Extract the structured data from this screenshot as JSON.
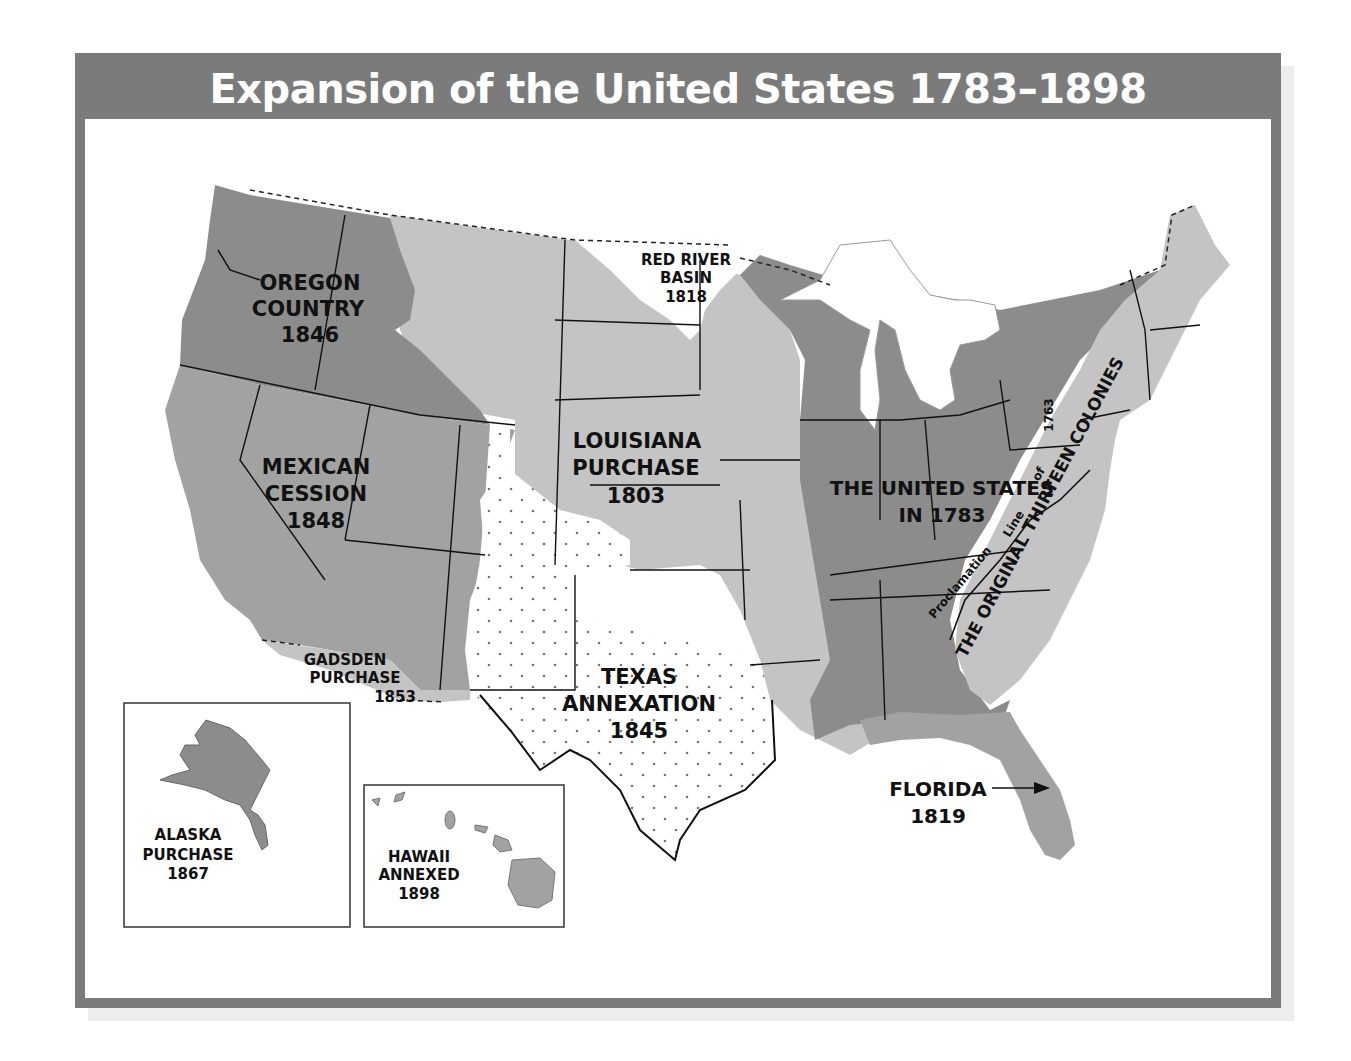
{
  "title": "Expansion of the United States 1783–1898",
  "colors": {
    "frame": "#7b7b7b",
    "dark_territory": "#8c8c8c",
    "medium_territory": "#a2a2a2",
    "light_territory": "#c4c4c4",
    "texas_fill": "#ffffff",
    "border_lines": "#111111"
  },
  "regions": {
    "oregon": {
      "line1": "OREGON",
      "line2": "COUNTRY",
      "year": "1846"
    },
    "mexican": {
      "line1": "MEXICAN",
      "line2": "CESSION",
      "year": "1848"
    },
    "gadsden": {
      "line1": "GADSDEN",
      "line2": "PURCHASE",
      "year": "1853"
    },
    "louisiana": {
      "line1": "LOUISIANA",
      "line2": "PURCHASE",
      "year": "1803"
    },
    "red_river": {
      "line1": "RED RIVER",
      "line2": "BASIN",
      "year": "1818"
    },
    "texas": {
      "line1": "TEXAS",
      "line2": "ANNEXATION",
      "year": "1845"
    },
    "us1783": {
      "line1": "THE UNITED STATES",
      "line2": "IN 1783"
    },
    "colonies": {
      "label": "THE ORIGINAL THIRTEEN COLONIES"
    },
    "proclamation": {
      "word1": "Proclamation",
      "word2": "Line",
      "word3": "of",
      "word4": "1763"
    },
    "florida": {
      "line1": "FLORIDA",
      "year": "1819"
    },
    "alaska": {
      "line1": "ALASKA",
      "line2": "PURCHASE",
      "year": "1867"
    },
    "hawaii": {
      "line1": "HAWAII",
      "line2": "ANNEXED",
      "year": "1898"
    }
  }
}
